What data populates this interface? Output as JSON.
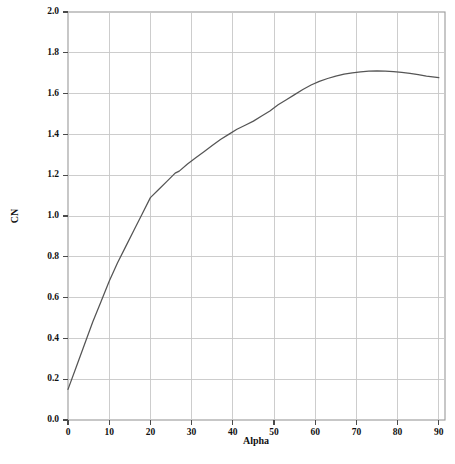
{
  "chart_data": {
    "type": "line",
    "title": "",
    "xlabel": "Alpha",
    "ylabel": "CN",
    "xlim": [
      0,
      90
    ],
    "ylim": [
      0.0,
      2.0
    ],
    "xticks": [
      0,
      10,
      20,
      30,
      40,
      50,
      60,
      70,
      80,
      90
    ],
    "xtick_labels": [
      "0",
      "10",
      "20",
      "30",
      "40",
      "50",
      "60",
      "70",
      "80",
      "90"
    ],
    "yticks": [
      0.0,
      0.2,
      0.4,
      0.6,
      0.8,
      1.0,
      1.2,
      1.4,
      1.6,
      1.8,
      2.0
    ],
    "ytick_labels": [
      "0.0",
      "0.2",
      "0.4",
      "0.6",
      "0.8",
      "1.0",
      "1.2",
      "1.4",
      "1.6",
      "1.8",
      "2.0"
    ],
    "grid": true,
    "grid_axes": "both",
    "legend": false,
    "legend_position": "none",
    "x_axis_overrun_max": 91.5,
    "series": [
      {
        "name": "CN",
        "color": "#555555",
        "x": [
          0,
          2,
          4,
          6,
          8,
          10,
          12,
          14,
          16,
          18,
          20,
          22,
          24,
          26,
          27,
          29,
          31,
          33,
          35,
          37,
          39,
          41,
          43,
          45,
          47,
          49,
          51,
          53,
          55,
          57,
          59,
          61,
          63,
          65,
          67,
          69,
          71,
          73,
          75,
          77,
          79,
          81,
          83,
          85,
          87,
          90
        ],
        "y": [
          0.15,
          0.26,
          0.37,
          0.48,
          0.58,
          0.68,
          0.77,
          0.85,
          0.93,
          1.01,
          1.09,
          1.13,
          1.17,
          1.21,
          1.22,
          1.255,
          1.285,
          1.315,
          1.345,
          1.375,
          1.4,
          1.425,
          1.445,
          1.465,
          1.49,
          1.515,
          1.545,
          1.57,
          1.595,
          1.62,
          1.642,
          1.66,
          1.674,
          1.686,
          1.695,
          1.702,
          1.707,
          1.71,
          1.711,
          1.71,
          1.708,
          1.704,
          1.699,
          1.693,
          1.686,
          1.678
        ]
      }
    ]
  },
  "axes": {
    "y_title": "CN",
    "x_title": "Alpha"
  }
}
